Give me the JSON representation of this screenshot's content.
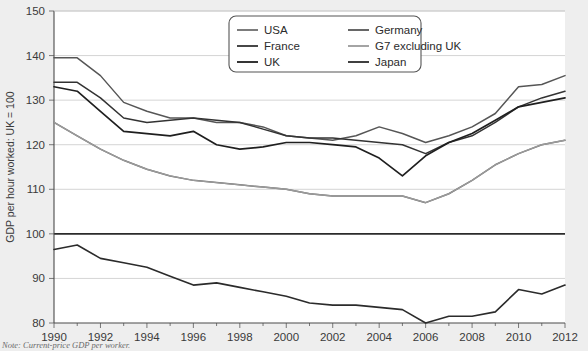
{
  "chart_data": {
    "type": "line",
    "title": "",
    "xlabel": "",
    "ylabel": "GDP per hour worked: UK = 100",
    "xlim": [
      1990,
      2012
    ],
    "ylim": [
      80,
      150
    ],
    "yticks": [
      80,
      90,
      100,
      110,
      120,
      130,
      140,
      150
    ],
    "xticks": [
      1990,
      1992,
      1994,
      1996,
      1998,
      2000,
      2002,
      2004,
      2006,
      2008,
      2010,
      2012
    ],
    "xtick_labels": [
      "1990",
      "1992",
      "1994",
      "1996",
      "1998",
      "2000",
      "2002",
      "2004",
      "2006",
      "2008",
      "2010",
      "2012"
    ],
    "ytick_labels": [
      "80",
      "90",
      "100",
      "110",
      "120",
      "130",
      "140",
      "150"
    ],
    "grid": true,
    "reference_line": 100,
    "legend_position": "top-right",
    "x": [
      1990,
      1991,
      1992,
      1993,
      1994,
      1995,
      1996,
      1997,
      1998,
      1999,
      2000,
      2001,
      2002,
      2003,
      2004,
      2005,
      2006,
      2007,
      2008,
      2009,
      2010,
      2011,
      2012
    ],
    "series": [
      {
        "name": "USA",
        "color": "#6e6e6e",
        "width": 1.5,
        "values": [
          125.0,
          122.0,
          119.0,
          116.5,
          114.5,
          113.0,
          112.0,
          111.5,
          111.0,
          110.5,
          110.0,
          109.0,
          108.5,
          108.5,
          108.5,
          108.5,
          107.0,
          109.0,
          112.0,
          115.5,
          118.0,
          120.0,
          121.0
        ]
      },
      {
        "name": "Germany",
        "color": "#565656",
        "width": 1.5,
        "values": [
          139.5,
          139.5,
          135.5,
          129.5,
          127.5,
          126.0,
          126.0,
          125.0,
          125.0,
          124.0,
          122.0,
          121.5,
          121.0,
          122.0,
          124.0,
          122.5,
          120.5,
          122.0,
          124.0,
          127.0,
          133.0,
          133.5,
          135.5
        ]
      },
      {
        "name": "France",
        "color": "#333333",
        "width": 1.5,
        "values": [
          134.0,
          134.0,
          130.5,
          126.0,
          125.0,
          125.5,
          126.0,
          125.5,
          125.0,
          123.5,
          122.0,
          121.5,
          121.5,
          121.0,
          120.5,
          120.0,
          118.0,
          120.5,
          122.0,
          125.0,
          128.5,
          130.5,
          132.0
        ]
      },
      {
        "name": "G7 excluding UK",
        "color": "#9a9a9a",
        "width": 1.4,
        "values": [
          125.0,
          122.0,
          119.0,
          116.5,
          114.5,
          113.0,
          112.0,
          111.5,
          111.0,
          110.5,
          110.0,
          109.0,
          108.5,
          108.5,
          108.5,
          108.5,
          107.0,
          109.0,
          112.0,
          115.5,
          118.0,
          120.0,
          121.0
        ]
      },
      {
        "name": "UK",
        "color": "#1f1f1f",
        "width": 1.7,
        "values": [
          133.0,
          132.0,
          127.5,
          123.0,
          122.5,
          122.0,
          123.0,
          120.0,
          119.0,
          119.5,
          120.5,
          120.5,
          120.0,
          119.5,
          117.0,
          113.0,
          117.5,
          120.5,
          122.5,
          125.5,
          128.5,
          129.5,
          130.5
        ]
      },
      {
        "name": "Japan",
        "color": "#2b2b2b",
        "width": 1.6,
        "values": [
          96.5,
          97.5,
          94.5,
          93.5,
          92.5,
          90.5,
          88.5,
          89.0,
          88.0,
          87.0,
          86.0,
          84.5,
          84.0,
          84.0,
          83.5,
          83.0,
          80.0,
          81.5,
          81.5,
          82.5,
          87.5,
          86.5,
          88.5
        ]
      }
    ],
    "legend_entries": [
      {
        "label": "USA",
        "color": "#6e6e6e"
      },
      {
        "label": "Germany",
        "color": "#565656"
      },
      {
        "label": "France",
        "color": "#333333"
      },
      {
        "label": "G7 excluding UK",
        "color": "#9a9a9a"
      },
      {
        "label": "UK",
        "color": "#1f1f1f"
      },
      {
        "label": "Japan",
        "color": "#2b2b2b"
      }
    ],
    "note": "Note: Current-price GDP per worker."
  },
  "figure": {
    "note": "Note: Current-price GDP per worker.",
    "ylabel": "GDP per hour worked: UK = 100"
  }
}
